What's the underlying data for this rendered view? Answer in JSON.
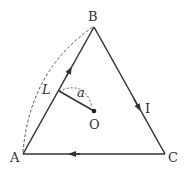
{
  "diagram": {
    "vertices": {
      "A": {
        "label": "A",
        "x": 23,
        "y": 154
      },
      "B": {
        "label": "B",
        "x": 94,
        "y": 27
      },
      "C": {
        "label": "C",
        "x": 165,
        "y": 154
      }
    },
    "center": {
      "label": "O",
      "x": 94,
      "y": 111
    },
    "side_length_label": "L",
    "distance_label": "a",
    "current_label": "I",
    "current_direction": "A→B→C→A",
    "colors": {
      "line": "#333333",
      "dashed": "#555555",
      "background": "#ffffff"
    }
  }
}
